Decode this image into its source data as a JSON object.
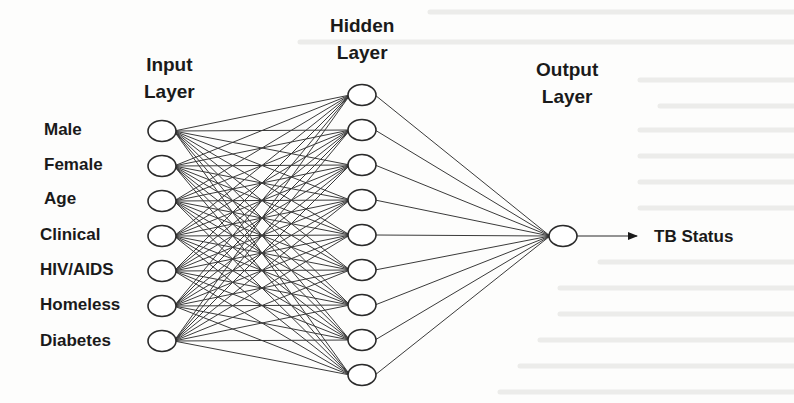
{
  "diagram": {
    "type": "neural-network",
    "layers": {
      "input": {
        "title_line1": "Input",
        "title_line2": "Layer",
        "nodes": [
          "Male",
          "Female",
          "Age",
          "Clinical",
          "HIV/AIDS",
          "Homeless",
          "Diabetes"
        ]
      },
      "hidden": {
        "title_line1": "Hidden",
        "title_line2": "Layer",
        "node_count": 9
      },
      "output": {
        "title_line1": "Output",
        "title_line2": "Layer",
        "node_count": 1,
        "target_label": "TB Status"
      }
    },
    "connections": "fully-connected",
    "colors": {
      "line": "#3a3a3a",
      "node_stroke": "#2a2a2a",
      "node_fill": "#ffffff",
      "text": "#1a1a1a",
      "background": "#fdfdfc"
    }
  }
}
